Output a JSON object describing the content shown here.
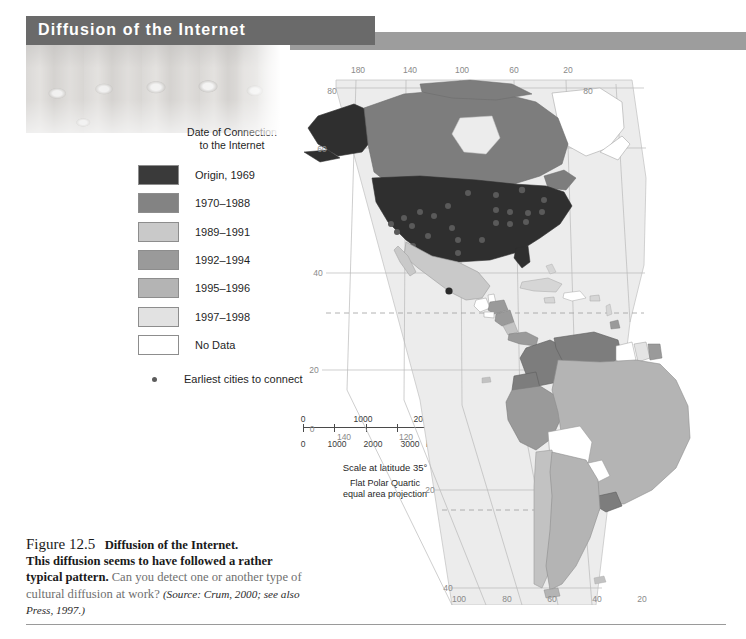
{
  "banner": {
    "title": "Diffusion of the Internet"
  },
  "legend": {
    "title": "Date of Connection\nto the Internet",
    "items": [
      {
        "label": "Origin, 1969",
        "color": "#3a3a3a"
      },
      {
        "label": "1970–1988",
        "color": "#838383"
      },
      {
        "label": "1989–1991",
        "color": "#c9c9c9"
      },
      {
        "label": "1992–1994",
        "color": "#9a9a9a"
      },
      {
        "label": "1995–1996",
        "color": "#b4b4b4"
      },
      {
        "label": "1997–1998",
        "color": "#e2e2e2"
      },
      {
        "label": "No Data",
        "color": "#ffffff"
      }
    ],
    "cities_marker_label": "Earliest cities to connect"
  },
  "scale": {
    "miles_ticks": [
      "0",
      "1000",
      "2000"
    ],
    "miles_unit": "mi.",
    "km_ticks": [
      "0",
      "1000",
      "2000",
      "3000"
    ],
    "km_unit": "km",
    "caption": "Scale at latitude 35°"
  },
  "projection": {
    "note": "Flat Polar Quartic\nequal area projection"
  },
  "map": {
    "top_longitude_labels": [
      "180",
      "140",
      "100",
      "60",
      "20"
    ],
    "bottom_longitude_labels": [
      "140",
      "120"
    ],
    "bottom_axis_labels": [
      "100",
      "80",
      "60",
      "40",
      "20"
    ],
    "left_latitude_labels": [
      "80",
      "60",
      "40",
      "20",
      "0"
    ],
    "right_latitude_labels": [
      "80"
    ],
    "lower_latitude_labels": [
      "20",
      "40"
    ]
  },
  "caption": {
    "figure_number": "Figure 12.5",
    "figure_title": "Diffusion of the Internet.",
    "body_strong": "This diffusion seems to have followed a rather typical pattern.",
    "body_light": "Can you detect one or another type of cultural diffusion at work?",
    "source": "(Source: Crum, 2000; see also Press, 1997.)"
  }
}
